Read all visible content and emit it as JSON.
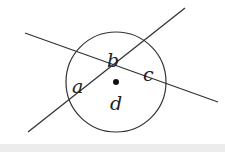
{
  "diagram": {
    "type": "intersecting-lines-angles",
    "labels": {
      "a": "a",
      "b": "b",
      "c": "c",
      "d": "d"
    },
    "colors": {
      "stroke": "#333333",
      "background": "#ffffff",
      "bottom_strip": "#ececec"
    }
  }
}
